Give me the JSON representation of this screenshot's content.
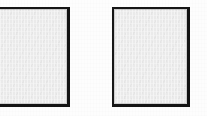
{
  "figure": {
    "background_color": "#fdfdfd",
    "width": 207,
    "height": 116,
    "panel_count": 2,
    "caption": ""
  },
  "style": {
    "border_color": "#141414",
    "fill_color": "#eaeaea",
    "inner_rule_color": "#787878"
  },
  "panels": [
    {
      "id": "panel-left",
      "label": "",
      "content": "",
      "fill_color": "#eaeaea",
      "border_color": "#141414",
      "x": 0,
      "y": 7,
      "width": 70,
      "height": 100,
      "clipped_edge": "left"
    },
    {
      "id": "panel-right",
      "label": "",
      "content": "",
      "fill_color": "#eaeaea",
      "border_color": "#141414",
      "x": 112,
      "y": 7,
      "width": 78,
      "height": 100,
      "clipped_edge": ""
    }
  ]
}
